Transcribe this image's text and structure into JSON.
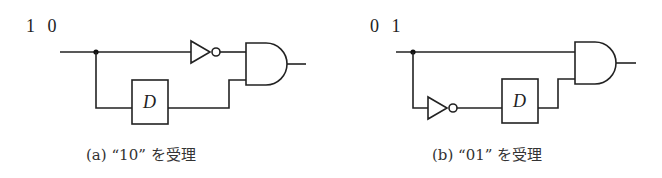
{
  "figures": [
    {
      "id": "a",
      "input_sequence_label": "1 0",
      "delay_label": "D",
      "caption": "(a)  “10” を受理",
      "components": [
        "input-junction",
        "inverter",
        "delay-D",
        "and-gate"
      ],
      "description": "Input goes through inverter to AND; input delayed by D to AND"
    },
    {
      "id": "b",
      "input_sequence_label": "0 1",
      "delay_label": "D",
      "caption": "(b)  “01” を受理",
      "components": [
        "input-junction",
        "inverter",
        "delay-D",
        "and-gate"
      ],
      "description": "Input goes directly to AND; inverted input delayed by D to AND"
    }
  ],
  "colors": {
    "line": "#222222",
    "background": "#ffffff"
  }
}
